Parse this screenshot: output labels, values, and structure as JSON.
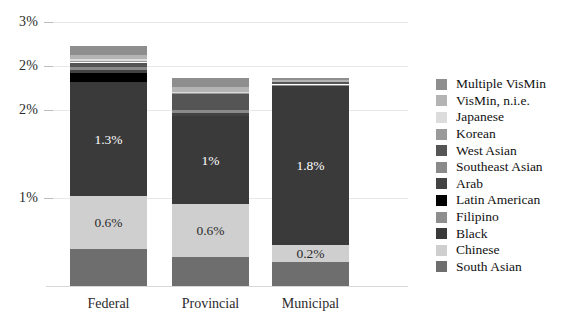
{
  "chart_data": {
    "type": "bar",
    "title": "",
    "subtitle": "",
    "xlabel": "",
    "ylabel": "",
    "stacked": true,
    "orientation": "vertical",
    "grid": true,
    "legend_position": "right",
    "ylim": [
      0,
      3.0
    ],
    "categories": [
      "Federal",
      "Provincial",
      "Municipal"
    ],
    "ytick_labels": [
      "3%",
      "2%",
      "2%",
      "1%"
    ],
    "ytick_values": [
      3.0,
      2.5,
      2.0,
      1.0
    ],
    "series": [
      {
        "name": "South Asian",
        "color": "#6e6e6e",
        "values": [
          0.42,
          0.33,
          0.27
        ]
      },
      {
        "name": "Chinese",
        "color": "#cfcfcf",
        "values": [
          0.6,
          0.6,
          0.2
        ]
      },
      {
        "name": "Black",
        "color": "#3a3a3a",
        "values": [
          1.3,
          1.0,
          1.8
        ]
      },
      {
        "name": "Latin American",
        "color": "#000000",
        "values": [
          0.1,
          0.0,
          0.0
        ]
      },
      {
        "name": "Arab",
        "color": "#434343",
        "values": [
          0.04,
          0.04,
          0.0
        ]
      },
      {
        "name": "Southeast Asian",
        "color": "#8a8a8a",
        "values": [
          0.03,
          0.03,
          0.02
        ]
      },
      {
        "name": "West Asian",
        "color": "#555555",
        "values": [
          0.05,
          0.18,
          0.03
        ]
      },
      {
        "name": "Korean",
        "color": "#9a9a9a",
        "values": [
          0.02,
          0.02,
          0.0
        ]
      },
      {
        "name": "Japanese",
        "color": "#dcdcdc",
        "values": [
          0.02,
          0.01,
          0.0
        ]
      },
      {
        "name": "VisMin, n.i.e.",
        "color": "#b4b4b4",
        "values": [
          0.05,
          0.05,
          0.02
        ]
      },
      {
        "name": "Multiple VisMin",
        "color": "#8e8e8e",
        "values": [
          0.1,
          0.1,
          0.02
        ]
      }
    ],
    "data_labels": [
      {
        "category": "Federal",
        "series": "Chinese",
        "text": "0.6%"
      },
      {
        "category": "Federal",
        "series": "Black",
        "text": "1.3%"
      },
      {
        "category": "Provincial",
        "series": "Chinese",
        "text": "0.6%"
      },
      {
        "category": "Provincial",
        "series": "Black",
        "text": "1%"
      },
      {
        "category": "Municipal",
        "series": "Chinese",
        "text": "0.2%"
      },
      {
        "category": "Municipal",
        "series": "Black",
        "text": "1.8%"
      }
    ],
    "legend_entries": [
      {
        "label": "Multiple VisMin",
        "color": "#8e8e8e"
      },
      {
        "label": "VisMin, n.i.e.",
        "color": "#b4b4b4"
      },
      {
        "label": "Japanese",
        "color": "#dcdcdc"
      },
      {
        "label": "Korean",
        "color": "#9a9a9a"
      },
      {
        "label": "West Asian",
        "color": "#555555"
      },
      {
        "label": "Southeast Asian",
        "color": "#8a8a8a"
      },
      {
        "label": "Arab",
        "color": "#434343"
      },
      {
        "label": "Latin American",
        "color": "#000000"
      },
      {
        "label": "Filipino",
        "color": "#8e8e8e"
      },
      {
        "label": "Black",
        "color": "#3a3a3a"
      },
      {
        "label": "Chinese",
        "color": "#cfcfcf"
      },
      {
        "label": "South Asian",
        "color": "#6e6e6e"
      }
    ]
  },
  "colors": {
    "background": "#ffffff",
    "gridline": "#e8e8e8",
    "axis": "#d8d8d8",
    "text": "#1a1a1a",
    "label_light": "#ffffff"
  }
}
